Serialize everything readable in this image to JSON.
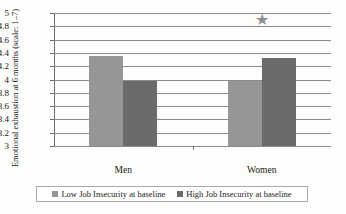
{
  "chart_data": {
    "type": "bar",
    "title": "",
    "xlabel": "",
    "ylabel": "Emotional exhaustion at 6 months (scale: 1–7)",
    "categories": [
      "Men",
      "Women"
    ],
    "series": [
      {
        "name": "Low Job Insecurity at baseline",
        "color": "#969696",
        "values": [
          4.35,
          3.97
        ]
      },
      {
        "name": "High Job Insecurity at baseline",
        "color": "#6b6b6b",
        "values": [
          3.97,
          4.33
        ]
      }
    ],
    "ylim": [
      3,
      5
    ],
    "ytick_step": 0.2,
    "yticks": [
      "3",
      "3.2",
      "3.4",
      "3.6",
      "3.8",
      "4",
      "4.2",
      "4.4",
      "4.6",
      "4.8",
      "5"
    ],
    "grid": true,
    "legend_position": "bottom",
    "annotations": [
      {
        "name": "significance-star",
        "symbol": "★",
        "category": "Women",
        "value": 4.9,
        "color": "#8e8e8e"
      }
    ]
  },
  "legend": {
    "items": [
      {
        "label": "Low Job Insecurity at baseline",
        "color": "#969696"
      },
      {
        "label": "High Job Insecurity at baseline",
        "color": "#6b6b6b"
      }
    ]
  }
}
